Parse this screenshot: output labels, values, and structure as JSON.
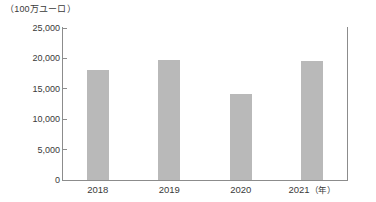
{
  "chart_data": {
    "type": "bar",
    "title": "",
    "subtitle": "",
    "unit_label": "（100万ユーロ）",
    "xlabel": "（年）",
    "ylabel": "",
    "categories": [
      "2018",
      "2019",
      "2020",
      "2021"
    ],
    "values": [
      18100,
      19700,
      14100,
      19600
    ],
    "series": [
      {
        "name": "",
        "values": [
          18100,
          19700,
          14100,
          19600
        ]
      }
    ],
    "ylim": [
      0,
      25000
    ],
    "yticks": [
      0,
      5000,
      10000,
      15000,
      20000,
      25000
    ],
    "ytick_labels": [
      "0",
      "5,000",
      "10,000",
      "15,000",
      "20,000",
      "25,000"
    ],
    "grid": false,
    "legend": false,
    "legend_position": "none",
    "bar_color": "#b9b9b9",
    "axis_color": "#8c8c8c",
    "text_color": "#3a3a3a",
    "background_color": "#ffffff"
  },
  "axis": {
    "y_caption": "（100万ユーロ）",
    "x_suffix": "（年）"
  }
}
